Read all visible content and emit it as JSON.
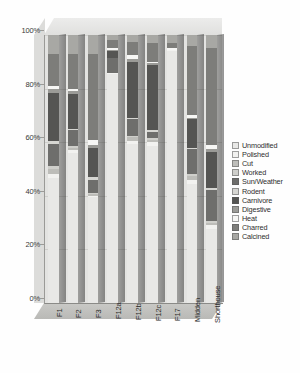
{
  "chart_data": {
    "type": "bar",
    "subtype": "stacked-100-percent-3d",
    "title": "",
    "xlabel": "",
    "ylabel": "",
    "ylim": [
      0,
      100
    ],
    "ytick_labels": [
      "0%",
      "20%",
      "40%",
      "60%",
      "80%",
      "100%"
    ],
    "ytick_values": [
      0,
      20,
      40,
      60,
      80,
      100
    ],
    "grid": true,
    "legend_position": "right",
    "categories": [
      "F1",
      "F2",
      "F3",
      "F12a",
      "F12b",
      "F12c",
      "F17",
      "Midden",
      "Shorthouse"
    ],
    "series": [
      {
        "name": "Unmodified",
        "color": "#e8e8e6",
        "values": [
          46.5,
          56.0,
          39.5,
          85.5,
          59.5,
          58.5,
          94.0,
          44.5,
          27.5
        ]
      },
      {
        "name": "Polished",
        "color": "#f2f2f0",
        "values": [
          1.5,
          1.0,
          0.5,
          0.5,
          1.0,
          1.5,
          0.5,
          1.5,
          1.5
        ]
      },
      {
        "name": "Cut",
        "color": "#bdbdb9",
        "values": [
          2.0,
          1.0,
          0.5,
          0.0,
          1.5,
          1.0,
          0.0,
          1.5,
          1.0
        ]
      },
      {
        "name": "Worked",
        "color": "#cfcfcb",
        "values": [
          1.0,
          0.5,
          0.5,
          0.0,
          0.5,
          0.5,
          0.0,
          0.5,
          0.5
        ]
      },
      {
        "name": "Sun/Weather",
        "color": "#6e6e6c",
        "values": [
          8.5,
          6.0,
          5.0,
          5.5,
          6.0,
          2.5,
          0.0,
          9.5,
          11.5
        ]
      },
      {
        "name": "Rodent",
        "color": "#d6d6d2",
        "values": [
          1.0,
          0.5,
          1.0,
          0.0,
          0.5,
          0.5,
          0.0,
          0.5,
          1.0
        ]
      },
      {
        "name": "Carnivore",
        "color": "#555553",
        "values": [
          18.0,
          13.0,
          11.0,
          2.5,
          21.0,
          24.5,
          0.0,
          10.5,
          13.5
        ]
      },
      {
        "name": "Digestive",
        "color": "#9b9b97",
        "values": [
          1.5,
          1.0,
          1.0,
          0.5,
          1.0,
          0.5,
          0.0,
          0.5,
          1.0
        ]
      },
      {
        "name": "Heat",
        "color": "#f7f7f5",
        "values": [
          1.0,
          1.0,
          2.0,
          0.5,
          1.5,
          0.5,
          0.5,
          1.0,
          1.5
        ]
      },
      {
        "name": "Charred",
        "color": "#7d7d7a",
        "values": [
          12.0,
          13.0,
          32.0,
          3.0,
          5.0,
          7.0,
          2.0,
          26.0,
          36.0
        ]
      },
      {
        "name": "Calcined",
        "color": "#a8a8a4",
        "values": [
          7.0,
          7.0,
          7.0,
          2.0,
          2.5,
          3.0,
          3.0,
          4.0,
          5.0
        ]
      }
    ]
  },
  "axes": {
    "y_ticks": [
      {
        "label": "100%",
        "value": 100
      },
      {
        "label": "80%",
        "value": 80
      },
      {
        "label": "60%",
        "value": 60
      },
      {
        "label": "40%",
        "value": 40
      },
      {
        "label": "20%",
        "value": 20
      },
      {
        "label": "0%",
        "value": 0
      }
    ],
    "x_ticks": [
      {
        "label": "F1"
      },
      {
        "label": "F2"
      },
      {
        "label": "F3"
      },
      {
        "label": "F12a"
      },
      {
        "label": "F12b"
      },
      {
        "label": "F12c"
      },
      {
        "label": "F17"
      },
      {
        "label": "Midden"
      },
      {
        "label": "Shorthouse"
      }
    ]
  },
  "legend": {
    "items": [
      {
        "label": "Unmodified",
        "color": "#e8e8e6"
      },
      {
        "label": "Polished",
        "color": "#f2f2f0"
      },
      {
        "label": "Cut",
        "color": "#bdbdb9"
      },
      {
        "label": "Worked",
        "color": "#cfcfcb"
      },
      {
        "label": "Sun/Weather",
        "color": "#6e6e6c"
      },
      {
        "label": "Rodent",
        "color": "#d6d6d2"
      },
      {
        "label": "Carnivore",
        "color": "#555553"
      },
      {
        "label": "Digestive",
        "color": "#9b9b97"
      },
      {
        "label": "Heat",
        "color": "#f7f7f5"
      },
      {
        "label": "Charred",
        "color": "#7d7d7a"
      },
      {
        "label": "Calcined",
        "color": "#a8a8a4"
      }
    ]
  }
}
